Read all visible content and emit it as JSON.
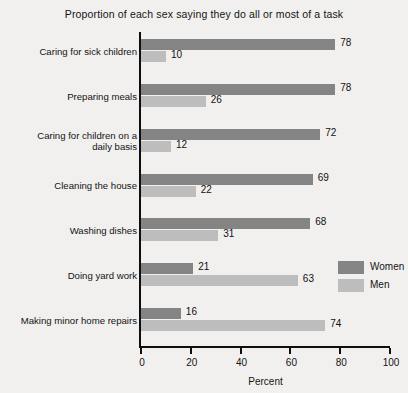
{
  "chart_data": {
    "type": "bar",
    "orientation": "horizontal",
    "title": "Proportion of each sex saying they do all or most of a task",
    "xlabel": "Percent",
    "ylabel": "",
    "xlim": [
      0,
      100
    ],
    "xticks": [
      0,
      20,
      40,
      60,
      80,
      100
    ],
    "xtick_labels": [
      "0",
      "20",
      "40",
      "60",
      "80",
      "100"
    ],
    "grid": false,
    "legend_position": "right-middle",
    "categories": [
      "Caring for sick children",
      "Preparing meals",
      "Caring for children on a daily basis",
      "Cleaning the house",
      "Washing dishes",
      "Doing yard work",
      "Making minor home repairs"
    ],
    "category_label_lines": [
      [
        "Caring for sick children"
      ],
      [
        "Preparing meals"
      ],
      [
        "Caring for children on a",
        "daily basis"
      ],
      [
        "Cleaning the house"
      ],
      [
        "Washing dishes"
      ],
      [
        "Doing yard work"
      ],
      [
        "Making minor home repairs"
      ]
    ],
    "series": [
      {
        "name": "Women",
        "color": "#848484",
        "values": [
          78,
          78,
          72,
          69,
          68,
          21,
          16
        ]
      },
      {
        "name": "Men",
        "color": "#bdbdbd",
        "values": [
          10,
          26,
          12,
          22,
          31,
          63,
          74
        ]
      }
    ]
  },
  "legend": {
    "items": [
      {
        "label": "Women",
        "color": "#848484"
      },
      {
        "label": "Men",
        "color": "#bdbdbd"
      }
    ]
  },
  "colors": {
    "background": "#f1f0ee",
    "axis": "#0e0e0e",
    "text": "#141414",
    "women": "#848484",
    "men": "#bdbdbd"
  }
}
